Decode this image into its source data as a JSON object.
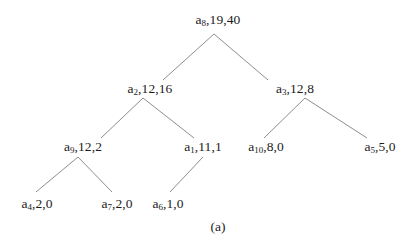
{
  "figure": {
    "caption": "(a)",
    "background_color": "#ffffff",
    "edge_color": "#808080",
    "text_color": "#1c1c1c"
  },
  "chart_data": {
    "type": "diagram",
    "diagram_type": "binary-tree",
    "title": "",
    "caption": "(a)",
    "node_label_format": "a<index>,<value1>,<value2>",
    "nodes": [
      {
        "id": "a8",
        "base": "a",
        "index": "8",
        "v1": "19",
        "v2": "40",
        "label": "a8,19,40",
        "depth": 0,
        "x": 218,
        "y": 20
      },
      {
        "id": "a2",
        "base": "a",
        "index": "2",
        "v1": "12",
        "v2": "16",
        "label": "a2,12,16",
        "depth": 1,
        "x": 150,
        "y": 89
      },
      {
        "id": "a3",
        "base": "a",
        "index": "3",
        "v1": "12",
        "v2": "8",
        "label": "a3,12,8",
        "depth": 1,
        "x": 295,
        "y": 89
      },
      {
        "id": "a9",
        "base": "a",
        "index": "9",
        "v1": "12",
        "v2": "2",
        "label": "a9,12,2",
        "depth": 2,
        "x": 83,
        "y": 147
      },
      {
        "id": "a1",
        "base": "a",
        "index": "1",
        "v1": "11",
        "v2": "1",
        "label": "a1,11,1",
        "depth": 2,
        "x": 203,
        "y": 147
      },
      {
        "id": "a10",
        "base": "a",
        "index": "10",
        "v1": "8",
        "v2": "0",
        "label": "a10,8,0",
        "depth": 2,
        "x": 266,
        "y": 147
      },
      {
        "id": "a5",
        "base": "a",
        "index": "5",
        "v1": "5",
        "v2": "0",
        "label": "a5,5,0",
        "depth": 2,
        "x": 380,
        "y": 147
      },
      {
        "id": "a4",
        "base": "a",
        "index": "4",
        "v1": "2",
        "v2": "0",
        "label": "a4,2,0",
        "depth": 3,
        "x": 37,
        "y": 204
      },
      {
        "id": "a7",
        "base": "a",
        "index": "7",
        "v1": "2",
        "v2": "0",
        "label": "a7,2,0",
        "depth": 3,
        "x": 117,
        "y": 204
      },
      {
        "id": "a6",
        "base": "a",
        "index": "6",
        "v1": "1",
        "v2": "0",
        "label": "a6,1,0",
        "depth": 3,
        "x": 168,
        "y": 204
      }
    ],
    "edges": [
      {
        "from": "a8",
        "to": "a2",
        "x1": 214,
        "y1": 34,
        "x2": 163,
        "y2": 80
      },
      {
        "from": "a8",
        "to": "a3",
        "x1": 214,
        "y1": 34,
        "x2": 268,
        "y2": 80
      },
      {
        "from": "a2",
        "to": "a9",
        "x1": 143,
        "y1": 98,
        "x2": 101,
        "y2": 138
      },
      {
        "from": "a2",
        "to": "a1",
        "x1": 143,
        "y1": 98,
        "x2": 194,
        "y2": 138
      },
      {
        "from": "a3",
        "to": "a10",
        "x1": 305,
        "y1": 98,
        "x2": 264,
        "y2": 138
      },
      {
        "from": "a3",
        "to": "a5",
        "x1": 305,
        "y1": 98,
        "x2": 367,
        "y2": 138
      },
      {
        "from": "a9",
        "to": "a4",
        "x1": 78,
        "y1": 157,
        "x2": 36,
        "y2": 192
      },
      {
        "from": "a9",
        "to": "a7",
        "x1": 78,
        "y1": 157,
        "x2": 112,
        "y2": 192
      },
      {
        "from": "a1",
        "to": "a6",
        "x1": 203,
        "y1": 157,
        "x2": 170,
        "y2": 192
      }
    ]
  }
}
